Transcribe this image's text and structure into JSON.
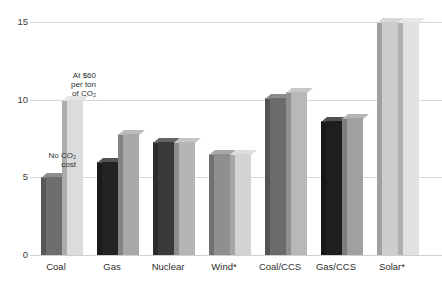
{
  "chart_data": {
    "type": "bar",
    "title": "",
    "subtitle": "",
    "xlabel": "",
    "ylabel": "",
    "ylim": [
      0,
      15
    ],
    "yticks": [
      0,
      5,
      10,
      15
    ],
    "ytick_labels": [
      "0",
      "5",
      "10",
      "15"
    ],
    "grid": true,
    "legend_position": "annotation",
    "categories": [
      "Coal",
      "Gas",
      "Nuclear",
      "Wind*",
      "Coal/CCS",
      "Gas/CCS",
      "Solar*"
    ],
    "series": [
      {
        "name": "No CO2 cost",
        "color": "#6e6e6e",
        "values": [
          5.0,
          6.0,
          7.3,
          6.5,
          10.1,
          8.6,
          15.0
        ],
        "bar_colors": [
          "#6e6e6e",
          "#232323",
          "#3a3a3a",
          "#8f8f8f",
          "#6b6b6b",
          "#1e1e1e",
          "#cdcdcd"
        ]
      },
      {
        "name": "At $60 per ton of CO2",
        "color": "#c9c9c9",
        "values": [
          10.0,
          7.8,
          7.3,
          6.5,
          10.5,
          8.8,
          15.0
        ],
        "bar_colors": [
          "#dcdcdc",
          "#a8a8a8",
          "#b5b5b5",
          "#d3d3d3",
          "#b8b8b8",
          "#a0a0a0",
          "#e2e2e2"
        ]
      }
    ],
    "annotations": [
      {
        "id": "no-cost",
        "text": "No CO₂\ncost",
        "target": "Coal / first bar"
      },
      {
        "id": "with-cost",
        "text": "At $60\nper ton\nof CO₂",
        "target": "Coal / second bar"
      }
    ],
    "footnote_marker": "*"
  },
  "axis": {
    "y_tick_0": "0",
    "y_tick_5": "5",
    "y_tick_10": "10",
    "y_tick_15": "15"
  },
  "categories": {
    "coal": "Coal",
    "gas": "Gas",
    "nuclear": "Nuclear",
    "wind": "Wind*",
    "coal_ccs": "Coal/CCS",
    "gas_ccs": "Gas/CCS",
    "solar": "Solar*"
  },
  "annotations": {
    "no_cost": "No CO₂\ncost",
    "with_cost": "At $60\nper ton\nof CO₂"
  },
  "colors": {
    "gridline": "#d8d8d8",
    "tick_text": "#3a3a3a",
    "label_text": "#2e2e2e",
    "background": "#ffffff"
  }
}
